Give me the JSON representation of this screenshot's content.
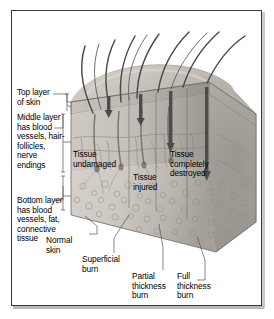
{
  "figure": {
    "border_color": "#3a3a3a",
    "background_color": "#ffffff"
  },
  "layer_labels": [
    {
      "id": "top-layer",
      "text": "Top layer\nof skin",
      "x": 6,
      "y": 78
    },
    {
      "id": "middle-layer",
      "text": "Middle layer\nhas blood\nvessels, hair-\nfollicles,\nnerve\nendings",
      "x": 6,
      "y": 103
    },
    {
      "id": "bottom-layer",
      "text": "Bottom layer\nhas blood\nvessels, fat,\nconnective\ntissue",
      "x": 6,
      "y": 186
    }
  ],
  "tissue_labels": [
    {
      "id": "tissue-undamaged",
      "text": "Tissue\nundamaged",
      "x": 86,
      "y": 140
    },
    {
      "id": "tissue-injured",
      "text": "Tissue\ninjured",
      "x": 146,
      "y": 163
    },
    {
      "id": "tissue-completely-destroyed",
      "text": "Tissue\ncompletely\ndestroyed",
      "x": 183,
      "y": 140
    }
  ],
  "burn_labels": [
    {
      "id": "normal-skin",
      "text": "Normal\nskin",
      "x": 59,
      "y": 226
    },
    {
      "id": "superficial-burn",
      "text": "Superficial\nburn",
      "x": 95,
      "y": 245
    },
    {
      "id": "partial-thickness-burn",
      "text": "Partial\nthickness\nburn",
      "x": 145,
      "y": 262
    },
    {
      "id": "full-thickness-burn",
      "text": "Full\nthickness\nburn",
      "x": 190,
      "y": 272
    }
  ],
  "colors": {
    "epidermis": "#b9b5ae",
    "dermis": "#c3bfb8",
    "subcutaneous": "#cdc9c2",
    "hair": "#4a4a4a",
    "arrow": "#4c4c4c",
    "leader": "#555555",
    "vessel": "#8a8078",
    "top_surface": "#cbc8c1",
    "side_face": "#a9a5a0"
  },
  "arrows": [
    {
      "id": "arrow-normal-skin",
      "x": 118,
      "depth_label": "shallow-stop-above-epidermis"
    },
    {
      "id": "arrow-superficial-burn",
      "x": 140,
      "depth_label": "epidermis"
    },
    {
      "id": "arrow-partial-thickness",
      "x": 167,
      "depth_label": "dermis"
    },
    {
      "id": "arrow-full-thickness",
      "x": 205,
      "depth_label": "subcutaneous"
    }
  ]
}
